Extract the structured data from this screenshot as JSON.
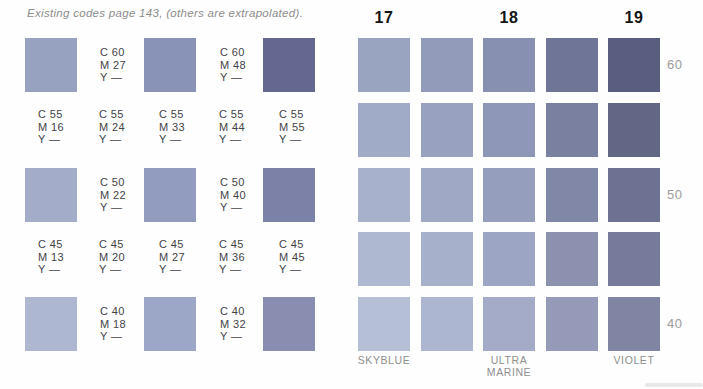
{
  "chart_data": {
    "type": "table",
    "title": "Existing codes page 143, (others are extrapolated).",
    "left_grid": {
      "description_rows": 5,
      "rows": [
        {
          "cells": [
            {
              "kind": "swatch",
              "color": "#97a2c0"
            },
            {
              "kind": "code",
              "lines": [
                "C 60",
                "M 27",
                "Y —"
              ]
            },
            {
              "kind": "swatch",
              "color": "#8893b7"
            },
            {
              "kind": "code",
              "lines": [
                "C 60",
                "M 48",
                "Y —"
              ]
            },
            {
              "kind": "swatch",
              "color": "#646890"
            }
          ]
        },
        {
          "cells": [
            {
              "kind": "code",
              "lines": [
                "C 55",
                "M 16",
                "Y —"
              ]
            },
            {
              "kind": "code",
              "lines": [
                "C 55",
                "M 24",
                "Y —"
              ]
            },
            {
              "kind": "code",
              "lines": [
                "C 55",
                "M 33",
                "Y —"
              ]
            },
            {
              "kind": "code",
              "lines": [
                "C 55",
                "M 44",
                "Y —"
              ]
            },
            {
              "kind": "code",
              "lines": [
                "C 55",
                "M 55",
                "Y —"
              ]
            }
          ]
        },
        {
          "cells": [
            {
              "kind": "swatch",
              "color": "#a3adca"
            },
            {
              "kind": "code",
              "lines": [
                "C 50",
                "M 22",
                "Y —"
              ]
            },
            {
              "kind": "swatch",
              "color": "#929cbe"
            },
            {
              "kind": "code",
              "lines": [
                "C 50",
                "M 40",
                "Y —"
              ]
            },
            {
              "kind": "swatch",
              "color": "#7c81a8"
            }
          ]
        },
        {
          "cells": [
            {
              "kind": "code",
              "lines": [
                "C 45",
                "M 13",
                "Y —"
              ]
            },
            {
              "kind": "code",
              "lines": [
                "C 45",
                "M 20",
                "Y —"
              ]
            },
            {
              "kind": "code",
              "lines": [
                "C 45",
                "M 27",
                "Y —"
              ]
            },
            {
              "kind": "code",
              "lines": [
                "C 45",
                "M 36",
                "Y —"
              ]
            },
            {
              "kind": "code",
              "lines": [
                "C 45",
                "M 45",
                "Y —"
              ]
            }
          ]
        },
        {
          "cells": [
            {
              "kind": "swatch",
              "color": "#adb7d1"
            },
            {
              "kind": "code",
              "lines": [
                "C 40",
                "M 18",
                "Y —"
              ]
            },
            {
              "kind": "swatch",
              "color": "#9ca6c6"
            },
            {
              "kind": "code",
              "lines": [
                "C 40",
                "M 32",
                "Y —"
              ]
            },
            {
              "kind": "swatch",
              "color": "#898eb0"
            }
          ]
        }
      ]
    },
    "right_grid": {
      "column_headers": [
        "17",
        "18",
        "19"
      ],
      "header_cols": [
        0,
        2,
        4
      ],
      "row_labels": [
        "60",
        "50",
        "40"
      ],
      "label_rows": [
        0,
        2,
        4
      ],
      "footers": [
        {
          "col": 0,
          "lines": [
            "SKYBLUE"
          ]
        },
        {
          "col": 2,
          "lines": [
            "ULTRA",
            "MARINE"
          ]
        },
        {
          "col": 4,
          "lines": [
            "VIOLET"
          ]
        }
      ],
      "rows": [
        [
          "#99a4c1",
          "#929cba",
          "#8790b1",
          "#6f7596",
          "#595d7f"
        ],
        [
          "#a0abc7",
          "#98a2c0",
          "#8e97b7",
          "#7a809f",
          "#636786"
        ],
        [
          "#a7b1cc",
          "#9fa9c6",
          "#959ebd",
          "#8188a7",
          "#6d7192"
        ],
        [
          "#aeb8d1",
          "#a6b0cb",
          "#9ca5c3",
          "#8b91af",
          "#777b9b"
        ],
        [
          "#b5bfd6",
          "#adb6d0",
          "#a3abc8",
          "#949ab7",
          "#8185a4"
        ]
      ]
    }
  }
}
